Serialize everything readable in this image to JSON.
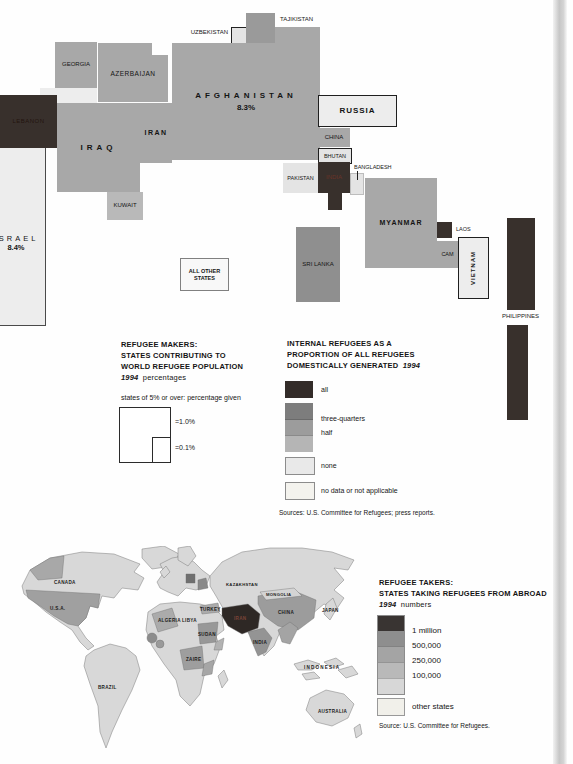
{
  "colors": {
    "internal_all": "#38302c",
    "internal_three_quarters": "#7d7d7d",
    "internal_half": "#9c9c9c",
    "internal_quarter": "#b5b5b5",
    "internal_none": "#e9e9e9",
    "internal_no_data": "#f4f3ee",
    "takers_1m": "#393432",
    "takers_500k": "#8e8e8e",
    "takers_250k": "#a4a4a4",
    "takers_100k": "#b9b9b9",
    "takers_low": "#d7d7d7",
    "takers_other": "#f1f0ea"
  },
  "cartogram": {
    "afghanistan": {
      "label": "AFGHANISTAN",
      "pct": "8.3%"
    },
    "israel": {
      "label": "ISRAEL",
      "pct": "8.4%"
    },
    "labels": {
      "tajikistan": "TAJIKISTAN",
      "uzbekistan": "UZBEKISTAN",
      "georgia": "GEORGIA",
      "azerbaijan": "AZERBAIJAN",
      "lebanon": "LEBANON",
      "iraq": "IRAQ",
      "iran": "IRAN",
      "kuwait": "KUWAIT",
      "russia": "RUSSIA",
      "china": "CHINA",
      "bhutan": "BHUTAN",
      "pakistan": "PAKISTAN",
      "india": "INDIA",
      "bangladesh": "BANGLADESH",
      "myanmar": "MYANMAR",
      "laos": "LAOS",
      "cambodia": "CAM",
      "vietnam": "VIETNAM",
      "sri_lanka": "SRI LANKA",
      "philippines": "PHILIPPINES"
    },
    "all_other_states": {
      "line1": "ALL OTHER",
      "line2": "STATES"
    }
  },
  "legend_makers": {
    "title1": "REFUGEE MAKERS:",
    "title2": "STATES CONTRIBUTING TO",
    "title3": "WORLD REFUGEE POPULATION",
    "year": "1994",
    "unit": "percentages",
    "note": "states of 5% or over: percentage given",
    "square_big": "=1.0%",
    "square_small": "=0.1%"
  },
  "legend_internal": {
    "title1": "INTERNAL REFUGEES AS A",
    "title2": "PROPORTION OF ALL REFUGEES",
    "title3": "DOMESTICALLY GENERATED",
    "year": "1994",
    "items": {
      "all": "all",
      "three_quarters": "three-quarters",
      "half": "half",
      "none": "none",
      "no_data": "no data or not applicable"
    },
    "sources": "Sources: U.S. Committee for Refugees; press reports."
  },
  "world_map": {
    "labels": {
      "canada": "CANADA",
      "usa": "U.S.A.",
      "brazil": "BRAZIL",
      "algeria": "ALGERIA",
      "libya": "LIBYA",
      "turkey": "TURKEY",
      "sudan": "SUDAN",
      "zaire": "ZAIRE",
      "kazakhstan": "KAZAKHSTAN",
      "mongolia": "MONGOLIA",
      "china": "CHINA",
      "japan": "JAPAN",
      "india": "INDIA",
      "iran": "IRAN",
      "indonesia": "INDONESIA",
      "australia": "AUSTRALIA"
    }
  },
  "legend_takers": {
    "title1": "REFUGEE TAKERS:",
    "title2": "STATES TAKING REFUGEES FROM ABROAD",
    "year": "1994",
    "unit": "numbers",
    "items": {
      "m1": "1 million",
      "k500": "500,000",
      "k250": "250,000",
      "k100": "100,000",
      "other": "other states"
    },
    "source": "Source: U.S. Committee for Refugees."
  }
}
